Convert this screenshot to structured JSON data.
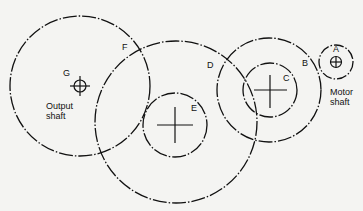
{
  "diagram": {
    "type": "gear train pitch circles",
    "gears": [
      {
        "id": "A",
        "label": "A",
        "cx": 336,
        "cy": 62,
        "r": 17,
        "note": "Motor shaft"
      },
      {
        "id": "B",
        "label": "B",
        "cx": 269,
        "cy": 90,
        "r": 52
      },
      {
        "id": "C",
        "label": "C",
        "cx": 270,
        "cy": 90,
        "r": 27
      },
      {
        "id": "D",
        "label": "D",
        "cx": 176,
        "cy": 122,
        "r": 81
      },
      {
        "id": "E",
        "label": "E",
        "cx": 175,
        "cy": 125,
        "r": 32
      },
      {
        "id": "F",
        "label": "F",
        "cx": 80,
        "cy": 86,
        "r": 70
      },
      {
        "id": "G",
        "label": "G",
        "cx": 80,
        "cy": 86,
        "r": 6
      }
    ],
    "labels": {
      "A": "A",
      "B": "B",
      "C": "C",
      "D": "D",
      "E": "E",
      "F": "F",
      "G": "G",
      "motor_line1": "Motor",
      "motor_line2": "shaft",
      "output_line1": "Output",
      "output_line2": "shaft"
    }
  }
}
